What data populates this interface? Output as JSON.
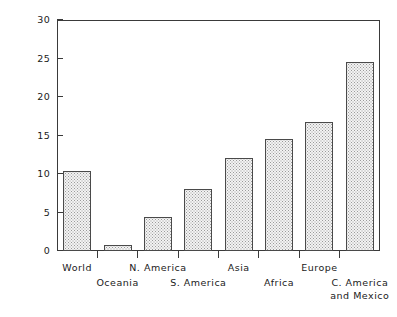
{
  "chart_data": {
    "type": "bar",
    "title": "",
    "xlabel": "",
    "ylabel": "Percentage of vegetated land",
    "ylim": [
      0,
      30
    ],
    "yticks": [
      0,
      5,
      10,
      15,
      20,
      25,
      30
    ],
    "ytick_labels": [
      "0",
      "5",
      "10",
      "15",
      "20",
      "25",
      "30"
    ],
    "grid": false,
    "legend": false,
    "categories": [
      "World",
      "Oceania",
      "N. America",
      "S. America",
      "Asia",
      "Africa",
      "Europe",
      "C. America and Mexico"
    ],
    "values": [
      10.4,
      0.8,
      4.4,
      8.0,
      12.1,
      14.5,
      16.8,
      24.5
    ]
  },
  "axes": {
    "y_title": "Percentage of vegetated land",
    "y_tick_labels": [
      "30",
      "25",
      "20",
      "15",
      "10",
      "5",
      "0"
    ],
    "x_labels": [
      {
        "text": "World",
        "row": 0
      },
      {
        "text": "Oceania",
        "row": 1
      },
      {
        "text": "N. America",
        "row": 0
      },
      {
        "text": "S. America",
        "row": 1
      },
      {
        "text": "Asia",
        "row": 0
      },
      {
        "text": "Africa",
        "row": 1
      },
      {
        "text": "Europe",
        "row": 0
      },
      {
        "text": "C. America",
        "row": 1
      },
      {
        "text": "and Mexico",
        "row": 2
      }
    ]
  },
  "colors": {
    "axis": "#3a3a3a",
    "bar_edge": "#4a4a4a",
    "bar_fill": "#f3f3f3",
    "bar_pattern": "#9a9a9a",
    "background": "#ffffff"
  }
}
